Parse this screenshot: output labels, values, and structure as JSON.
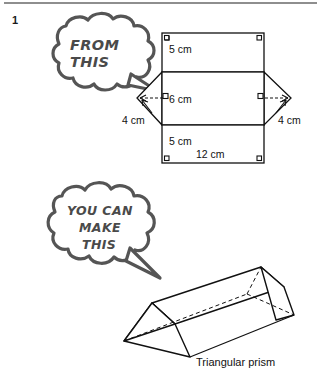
{
  "page": {
    "problem_number": "1",
    "divider": "horizontal-rule"
  },
  "bubbles": [
    {
      "id": "from-this",
      "lines": [
        "FROM",
        "THIS"
      ],
      "line1": "FROM",
      "line2": "THIS",
      "tail_direction": "right"
    },
    {
      "id": "you-can-make-this",
      "lines": [
        "YOU CAN",
        "MAKE",
        "THIS"
      ],
      "line1": "YOU CAN",
      "line2": "MAKE",
      "line3": "THIS",
      "tail_direction": "down-right"
    }
  ],
  "net": {
    "name": "triangular-prism-net",
    "labels": {
      "top_rect": "5 cm",
      "middle_rect": "6 cm",
      "bottom_rect": "5 cm",
      "base_width": "12 cm",
      "left_flap": "4 cm",
      "right_flap": "4 cm"
    },
    "right_angle_marks": 6
  },
  "prism": {
    "name": "triangular-prism",
    "caption": "Triangular prism"
  },
  "colors": {
    "ink": "#111111",
    "bubble_stroke": "#555555",
    "rule": "#8e8e8e",
    "paper": "#ffffff"
  }
}
